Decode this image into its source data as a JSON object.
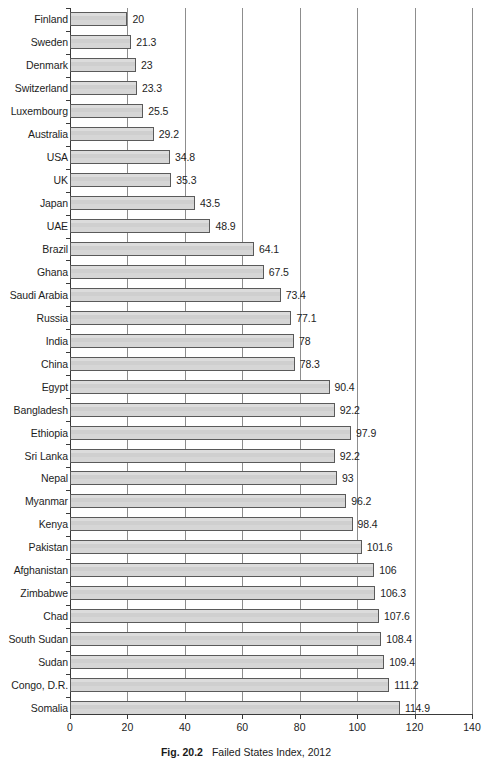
{
  "caption": {
    "figure_number": "Fig. 20.2",
    "text": "Failed States Index, 2012"
  },
  "axis": {
    "x_ticks": [
      "0",
      "20",
      "40",
      "60",
      "80",
      "100",
      "120",
      "140"
    ]
  },
  "chart_data": {
    "type": "bar",
    "orientation": "horizontal",
    "title": "Failed States Index, 2012",
    "xlabel": "",
    "ylabel": "",
    "xlim": [
      0,
      140
    ],
    "grid": true,
    "legend": "none",
    "bar_color": "#d3d3d3",
    "bar_edge_color": "#5a5a5a",
    "xticks": [
      0,
      20,
      40,
      60,
      80,
      100,
      120,
      140
    ],
    "categories": [
      "Finland",
      "Sweden",
      "Denmark",
      "Switzerland",
      "Luxembourg",
      "Australia",
      "USA",
      "UK",
      "Japan",
      "UAE",
      "Brazil",
      "Ghana",
      "Saudi Arabia",
      "Russia",
      "India",
      "China",
      "Egypt",
      "Bangladesh",
      "Ethiopia",
      "Sri Lanka",
      "Nepal",
      "Myanmar",
      "Kenya",
      "Pakistan",
      "Afghanistan",
      "Zimbabwe",
      "Chad",
      "South Sudan",
      "Sudan",
      "Congo, D.R.",
      "Somalia"
    ],
    "values": [
      20,
      21.3,
      23,
      23.3,
      25.5,
      29.2,
      34.8,
      35.3,
      43.5,
      48.9,
      64.1,
      67.5,
      73.4,
      77.1,
      78,
      78.3,
      90.4,
      92.2,
      97.9,
      92.2,
      93,
      96.2,
      98.4,
      101.6,
      106,
      106.3,
      107.6,
      108.4,
      109.4,
      111.2,
      114.9
    ],
    "value_labels": [
      "20",
      "21.3",
      "23",
      "23.3",
      "25.5",
      "29.2",
      "34.8",
      "35.3",
      "43.5",
      "48.9",
      "64.1",
      "67.5",
      "73.4",
      "77.1",
      "78",
      "78.3",
      "90.4",
      "92.2",
      "97.9",
      "92.2",
      "93",
      "96.2",
      "98.4",
      "101.6",
      "106",
      "106.3",
      "107.6",
      "108.4",
      "109.4",
      "111.2",
      "114.9"
    ]
  }
}
